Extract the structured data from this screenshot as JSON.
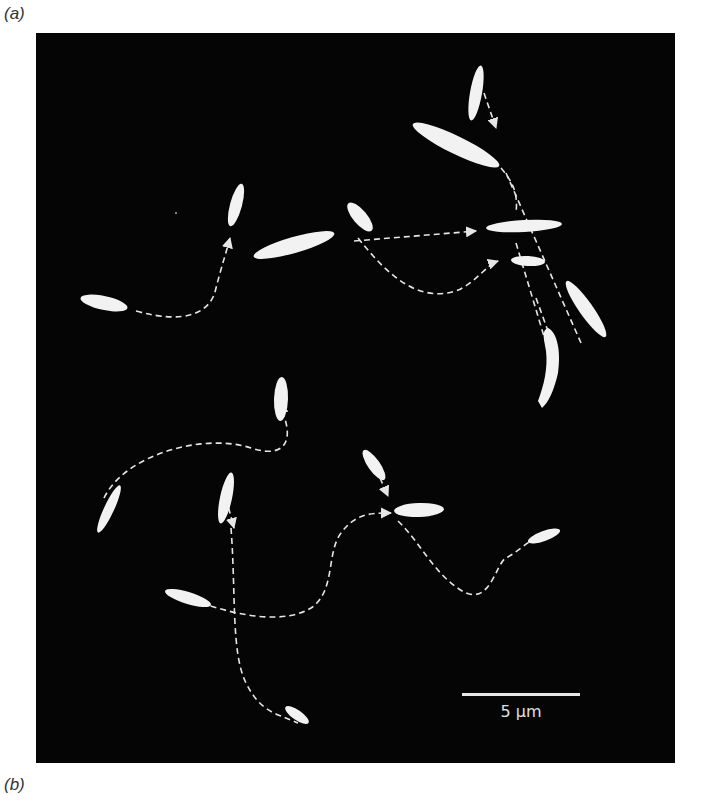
{
  "figure": {
    "panel_a_label": "(a)",
    "panel_b_label": "(b)",
    "scale_bar_label": "5 μm",
    "colors": {
      "background": "#050505",
      "cells": "#f2f2f2",
      "tracks": "#e6e6e6",
      "page": "#ffffff"
    }
  }
}
